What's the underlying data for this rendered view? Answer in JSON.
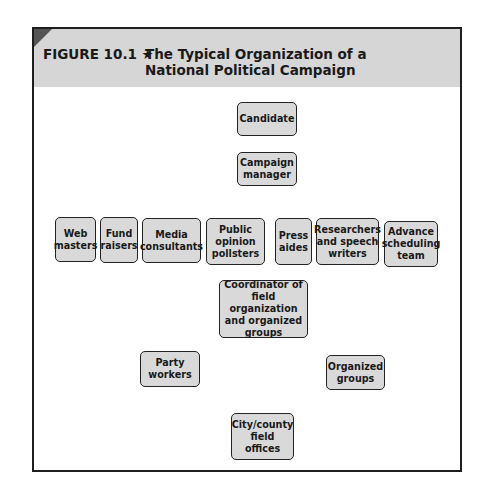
{
  "figure": {
    "label": "FIGURE 10.1 ★",
    "title": "The Typical Organization of a National Political Campaign",
    "colors": {
      "header_band": "#d6d6d6",
      "corner_accent": "#555555",
      "box_fill": "#d9d9d9",
      "line": "#1e1e1e"
    }
  },
  "nodes": {
    "candidate": "Candidate",
    "campaign_manager": "Campaign manager",
    "web_masters": "Web masters",
    "fund_raisers": "Fund raisers",
    "media_consultants": "Media consultants",
    "public_opinion_pollsters": "Public opinion pollsters",
    "press_aides": "Press aides",
    "researchers": "Researchers and speech writers",
    "advance_team": "Advance scheduling team",
    "coordinator": "Coordinator of field organization and organized groups",
    "party_workers": "Party workers",
    "organized_groups": "Organized groups",
    "field_offices": "City/county field offices"
  },
  "edges": [
    [
      "Candidate",
      "Campaign manager"
    ],
    [
      "Campaign manager",
      "Web masters"
    ],
    [
      "Campaign manager",
      "Fund raisers"
    ],
    [
      "Campaign manager",
      "Media consultants"
    ],
    [
      "Campaign manager",
      "Public opinion pollsters"
    ],
    [
      "Campaign manager",
      "Press aides"
    ],
    [
      "Campaign manager",
      "Researchers and speech writers"
    ],
    [
      "Campaign manager",
      "Advance scheduling team"
    ],
    [
      "Campaign manager",
      "Coordinator of field organization and organized groups"
    ],
    [
      "Coordinator of field organization and organized groups",
      "Party workers"
    ],
    [
      "Coordinator of field organization and organized groups",
      "Organized groups"
    ],
    [
      "Party workers",
      "City/county field offices"
    ],
    [
      "Organized groups",
      "City/county field offices"
    ],
    [
      "Advance scheduling team",
      "City/county field offices"
    ],
    [
      "Coordinator of field organization and organized groups",
      "City/county field offices"
    ]
  ]
}
